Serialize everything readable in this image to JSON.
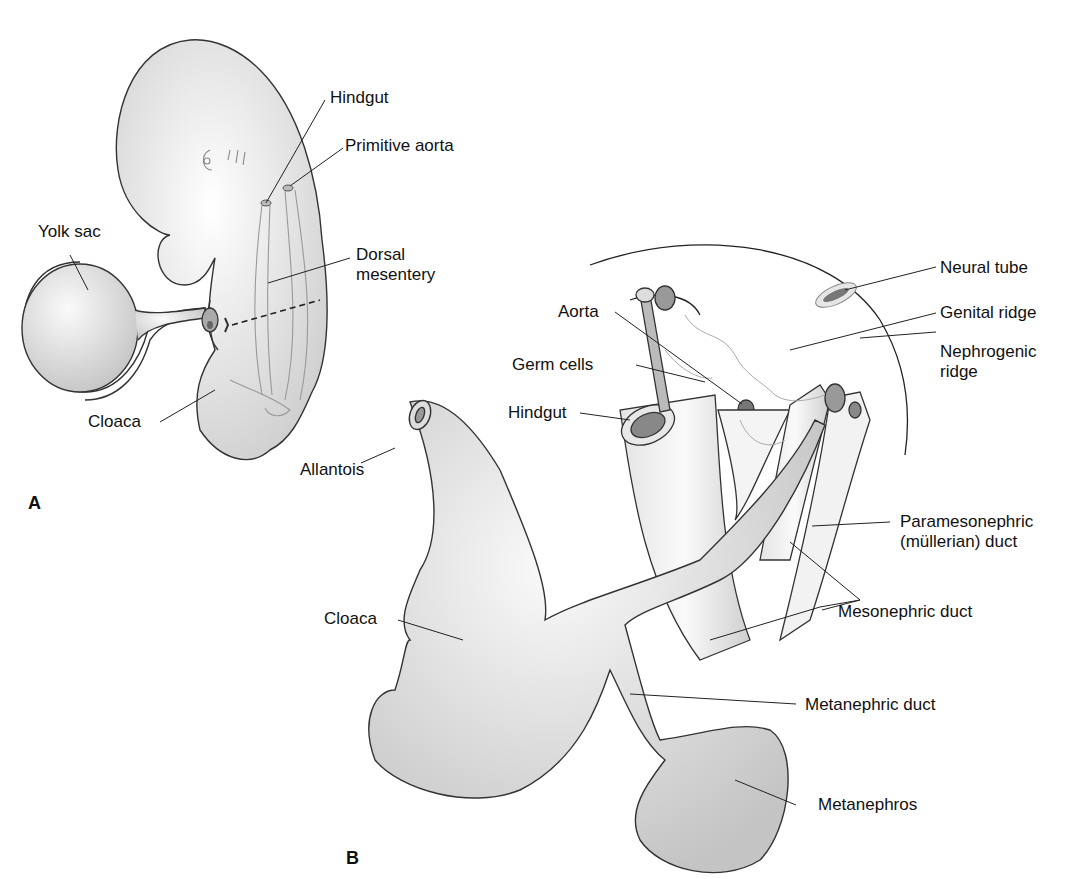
{
  "figure": {
    "panels": [
      {
        "id": "A",
        "label": "A",
        "labels": {
          "hindgut": "Hindgut",
          "primitive_aorta": "Primitive aorta",
          "yolk_sac": "Yolk sac",
          "dorsal_mesentery_1": "Dorsal",
          "dorsal_mesentery_2": "mesentery",
          "cloaca": "Cloaca"
        }
      },
      {
        "id": "B",
        "label": "B",
        "labels": {
          "neural_tube": "Neural tube",
          "aorta": "Aorta",
          "genital_ridge": "Genital ridge",
          "germ_cells": "Germ cells",
          "nephrogenic_ridge_1": "Nephrogenic",
          "nephrogenic_ridge_2": "ridge",
          "hindgut": "Hindgut",
          "allantois": "Allantois",
          "paramesonephric_1": "Paramesonephric",
          "paramesonephric_2": "(müllerian) duct",
          "cloaca": "Cloaca",
          "mesonephric_duct": "Mesonephric duct",
          "metanephric_duct": "Metanephric duct",
          "metanephros": "Metanephros"
        }
      }
    ]
  }
}
